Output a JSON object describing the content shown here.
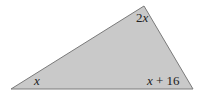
{
  "figure": {
    "type": "triangle",
    "fill_color": "#c9c9c9",
    "stroke_color": "#7a7a7a",
    "vertices": {
      "left": [
        11,
        89
      ],
      "top": [
        144,
        6
      ],
      "right": [
        193,
        89
      ]
    },
    "angle_labels": {
      "top": {
        "coef": "2",
        "var": "x"
      },
      "left": {
        "var": "x"
      },
      "right": {
        "var": "x",
        "rest": " + 16"
      }
    }
  }
}
